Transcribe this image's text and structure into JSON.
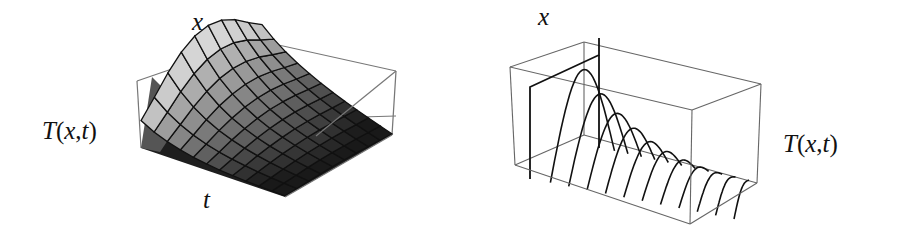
{
  "chart_data": [
    {
      "type": "surface3d",
      "title": "",
      "function": "T(x,t)",
      "labels": {
        "x_axis": "x",
        "t_axis": "t",
        "z_axis": "T(x,t)"
      },
      "description": "Shaded 3D surface of temperature T(x,t): peaked along x at t=0, decaying to zero as t increases",
      "grid": {
        "x_lines": 9,
        "t_lines": 11
      },
      "box": {
        "top_front_left": [
          137,
          81
        ],
        "top_back": [
          256,
          40
        ],
        "top_right": [
          396,
          71
        ],
        "bottom_front_left": [
          141,
          148
        ],
        "bottom_front": [
          285,
          197
        ],
        "bottom_right": [
          392,
          135
        ],
        "inner_bottom": [
          316,
          112
        ]
      },
      "colors": {
        "light_face": "#c8c8c8",
        "mid_face": "#8a8a8a",
        "dark_face": "#1e1e1e",
        "grid": "#111111",
        "box": "#777777"
      }
    },
    {
      "type": "line3d",
      "title": "",
      "function": "T(x,t)",
      "labels": {
        "x_axis": "x",
        "z_axis": "T(x,t)"
      },
      "description": "Sequence of sine-arch profiles T(x,t) at successive times; initial square pulse then decaying arches",
      "profiles": 12,
      "peak_heights": [
        1.0,
        0.82,
        0.64,
        0.5,
        0.4,
        0.31,
        0.25,
        0.2,
        0.16,
        0.13,
        0.11,
        0.09
      ],
      "box": {
        "top_front_left": [
          510,
          67
        ],
        "top_back": [
          584,
          42
        ],
        "top_right": [
          761,
          84
        ],
        "top_front_right": [
          692,
          110
        ],
        "bottom_front_left": [
          515,
          165
        ],
        "bottom_back": [
          584,
          135
        ],
        "bottom_right": [
          757,
          183
        ],
        "bottom_front_right": [
          690,
          224
        ]
      },
      "colors": {
        "curve": "#111111",
        "box": "#666666"
      }
    }
  ],
  "labels": {
    "left_x": "x",
    "left_t": "t",
    "left_T": "T(x,t)",
    "right_x": "x",
    "right_T": "T(x,t)"
  }
}
